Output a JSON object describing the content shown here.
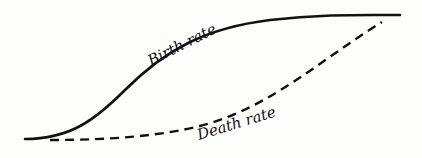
{
  "diagram": {
    "type": "demographic-transition",
    "curves": [
      {
        "name": "Birth rate",
        "style": "solid",
        "color": "#111111",
        "path": "M 25 139 C 70 139, 95 120, 125 90 C 165 50, 205 28, 270 20 C 320 14, 360 15, 400 15"
      },
      {
        "name": "Death rate",
        "style": "dashed",
        "color": "#111111",
        "path": "M 50 140 C 110 140, 160 136, 200 126 C 270 108, 320 60, 382 22"
      }
    ],
    "labels": {
      "birth_rate": "Birth rate",
      "death_rate": "Death rate"
    }
  }
}
